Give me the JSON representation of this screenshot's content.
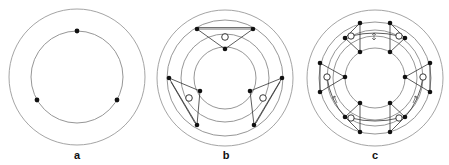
{
  "figure": {
    "panels": [
      {
        "id": "a",
        "label": "a",
        "description": "Two concentric circles with three filled dots on the inner circle",
        "center": [
          77,
          77
        ],
        "rings": [
          68,
          46
        ],
        "filled_dots": 3,
        "hollow_dots": 0
      },
      {
        "id": "b",
        "label": "b",
        "description": "Four concentric rings; three triangular linkages each with a hollow node",
        "center": [
          225,
          78
        ],
        "rings": [
          68,
          58,
          44,
          31
        ],
        "filled_dots": 9,
        "hollow_dots": 3
      },
      {
        "id": "c",
        "label": "c",
        "description": "Multiple concentric rings; six linkage groups with hollow nodes containing small marks and arrows",
        "center": [
          375,
          78
        ],
        "rings": [
          68,
          56,
          48,
          42,
          30
        ],
        "filled_dots": 18,
        "hollow_dots": 6
      }
    ],
    "colors": {
      "ring": "#8a8a8a",
      "dot": "#111111",
      "link": "#333333",
      "background": "#ffffff"
    }
  }
}
